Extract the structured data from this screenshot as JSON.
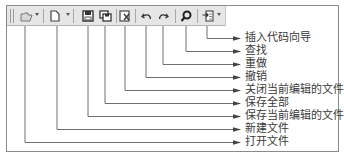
{
  "diagram": {
    "title": "",
    "toolbar_buttons": [
      {
        "id": "open",
        "icon": "open-folder-icon",
        "has_dropdown": true,
        "label": "打开文件"
      },
      {
        "id": "new",
        "icon": "new-file-icon",
        "has_dropdown": true,
        "label": "新建文件"
      },
      {
        "id": "save",
        "icon": "save-icon",
        "has_dropdown": false,
        "label": "保存当前编辑的文件"
      },
      {
        "id": "save_all",
        "icon": "save-all-icon",
        "has_dropdown": false,
        "label": "保存全部"
      },
      {
        "id": "close",
        "icon": "close-file-icon",
        "has_dropdown": false,
        "label": "关闭当前编辑的文件"
      },
      {
        "id": "undo",
        "icon": "undo-icon",
        "has_dropdown": false,
        "label": "撤销"
      },
      {
        "id": "redo",
        "icon": "redo-icon",
        "has_dropdown": false,
        "label": "重做"
      },
      {
        "id": "find",
        "icon": "search-icon",
        "has_dropdown": false,
        "label": "查找"
      },
      {
        "id": "insert_code",
        "icon": "insert-code-wizard-icon",
        "has_dropdown": true,
        "label": "插入代码向导"
      }
    ],
    "callouts": [
      {
        "label": "插入代码向导",
        "x": 207,
        "y": 38
      },
      {
        "label": "查找",
        "x": 186,
        "y": 51
      },
      {
        "label": "重做",
        "x": 163,
        "y": 64
      },
      {
        "label": "撤销",
        "x": 146,
        "y": 77
      },
      {
        "label": "关闭当前编辑的文件",
        "x": 125,
        "y": 90
      },
      {
        "label": "保存全部",
        "x": 105,
        "y": 103
      },
      {
        "label": "保存当前编辑的文件",
        "x": 88,
        "y": 116
      },
      {
        "label": "新建文件",
        "x": 57,
        "y": 129
      },
      {
        "label": "打开文件",
        "x": 25,
        "y": 142
      }
    ],
    "colors": {
      "line": "#6e6e6e",
      "toolbar_bg": "#e6e6e6",
      "text": "#3a3a3a"
    }
  }
}
